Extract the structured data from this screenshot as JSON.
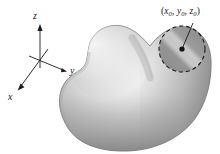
{
  "figure": {
    "kind": "math-diagram",
    "background_color": "#ffffff",
    "ink_color": "#1a1a1a"
  },
  "axes": {
    "origin": {
      "x": 40,
      "y": 60
    },
    "items": [
      {
        "id": "z",
        "label": "z",
        "direction": "up",
        "arrow_tip": {
          "x": 40,
          "y": 26
        },
        "label_pos": {
          "x": 33,
          "y": 11
        }
      },
      {
        "id": "y",
        "label": "y",
        "direction": "right-down",
        "arrow_tip": {
          "x": 67,
          "y": 71
        },
        "label_pos": {
          "x": 70,
          "y": 66
        }
      },
      {
        "id": "x",
        "label": "x",
        "direction": "left-down",
        "arrow_tip": {
          "x": 17,
          "y": 90
        },
        "label_pos": {
          "x": 8,
          "y": 92
        }
      }
    ]
  },
  "surface": {
    "name": "blob-surface",
    "fill_light": "#f2f2f2",
    "fill_mid": "#b3b3b3",
    "fill_dark": "#8a8a8a",
    "edge_color": "#6e6e6e",
    "highlight_center": {
      "x": 112,
      "y": 62
    }
  },
  "neighborhood": {
    "name": "dashed-circle",
    "center": {
      "x": 182,
      "y": 49
    },
    "radius": 23,
    "stroke_color": "#1a1a1a",
    "dash_pattern": "4 3",
    "fill_light": "#b9b9b9",
    "fill_dark": "#8f8f8f"
  },
  "point_marker": {
    "name": "point-dot",
    "center": {
      "x": 182,
      "y": 49
    },
    "radius": 2.6,
    "color": "#111111"
  },
  "leader_line": {
    "from": {
      "x": 182,
      "y": 49
    },
    "to": {
      "x": 193,
      "y": 23
    },
    "color": "#1a1a1a"
  },
  "point_label": {
    "open_paren": "(",
    "x_symbol": "x",
    "x_sub": "0",
    "comma_1": ", ",
    "y_symbol": "y",
    "y_sub": "0",
    "comma_2": ", ",
    "z_symbol": "z",
    "z_sub": "0",
    "close_paren": ")",
    "full_text": "(x0, y0, z0)"
  }
}
